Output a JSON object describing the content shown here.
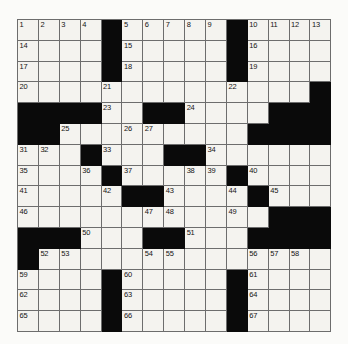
{
  "puzzle": {
    "title": "Crossword Grid",
    "type": "crossword",
    "rows": 15,
    "cols": 15,
    "colors": {
      "block": "#0a0a0a",
      "open": "#f4f3ef",
      "gridline": "#6d6d6d",
      "page": "#fbfbf9",
      "number": "#141414"
    },
    "legend": {
      "block_symbol": "#",
      "open_symbol": "."
    },
    "grid_pattern": [
      "....#.....#....",
      "....#.....#....",
      "....#.....#....",
      "....._....._..#",
      "####.....##....",
      "##.........####",
      "...#...##......",
      "...._#...__#...",
      "....._##...#_..",
      "......__...._##",
      "###..._##..#####",
      "#..........____",
      "....#.....#....",
      "....#.....#....",
      "....#.....#...."
    ],
    "blocks": [
      [
        0,
        4
      ],
      [
        0,
        10
      ],
      [
        1,
        4
      ],
      [
        1,
        10
      ],
      [
        2,
        4
      ],
      [
        2,
        10
      ],
      [
        3,
        14
      ],
      [
        4,
        0
      ],
      [
        4,
        1
      ],
      [
        4,
        2
      ],
      [
        4,
        3
      ],
      [
        4,
        6
      ],
      [
        4,
        7
      ],
      [
        4,
        12
      ],
      [
        4,
        13
      ],
      [
        4,
        14
      ],
      [
        5,
        0
      ],
      [
        5,
        1
      ],
      [
        5,
        11
      ],
      [
        5,
        12
      ],
      [
        5,
        13
      ],
      [
        5,
        14
      ],
      [
        6,
        3
      ],
      [
        6,
        7
      ],
      [
        6,
        8
      ],
      [
        7,
        4
      ],
      [
        7,
        10
      ],
      [
        8,
        5
      ],
      [
        8,
        6
      ],
      [
        8,
        11
      ],
      [
        9,
        12
      ],
      [
        9,
        13
      ],
      [
        9,
        14
      ],
      [
        10,
        0
      ],
      [
        10,
        1
      ],
      [
        10,
        2
      ],
      [
        10,
        6
      ],
      [
        10,
        7
      ],
      [
        10,
        11
      ],
      [
        10,
        12
      ],
      [
        10,
        13
      ],
      [
        10,
        14
      ],
      [
        11,
        0
      ],
      [
        12,
        4
      ],
      [
        12,
        10
      ],
      [
        13,
        4
      ],
      [
        13,
        10
      ],
      [
        14,
        4
      ],
      [
        14,
        10
      ]
    ],
    "numbers": [
      {
        "n": 1,
        "row": 0,
        "col": 0
      },
      {
        "n": 2,
        "row": 0,
        "col": 1
      },
      {
        "n": 3,
        "row": 0,
        "col": 2
      },
      {
        "n": 4,
        "row": 0,
        "col": 3
      },
      {
        "n": 5,
        "row": 0,
        "col": 5
      },
      {
        "n": 6,
        "row": 0,
        "col": 6
      },
      {
        "n": 7,
        "row": 0,
        "col": 7
      },
      {
        "n": 8,
        "row": 0,
        "col": 8
      },
      {
        "n": 9,
        "row": 0,
        "col": 9
      },
      {
        "n": 10,
        "row": 0,
        "col": 11
      },
      {
        "n": 11,
        "row": 0,
        "col": 12
      },
      {
        "n": 12,
        "row": 0,
        "col": 13
      },
      {
        "n": 13,
        "row": 0,
        "col": 14
      },
      {
        "n": 14,
        "row": 1,
        "col": 0
      },
      {
        "n": 15,
        "row": 1,
        "col": 5
      },
      {
        "n": 16,
        "row": 1,
        "col": 11
      },
      {
        "n": 17,
        "row": 2,
        "col": 0
      },
      {
        "n": 18,
        "row": 2,
        "col": 5
      },
      {
        "n": 19,
        "row": 2,
        "col": 11
      },
      {
        "n": 20,
        "row": 3,
        "col": 0
      },
      {
        "n": 21,
        "row": 3,
        "col": 4
      },
      {
        "n": 22,
        "row": 3,
        "col": 10
      },
      {
        "n": 23,
        "row": 4,
        "col": 4
      },
      {
        "n": 24,
        "row": 4,
        "col": 8
      },
      {
        "n": 25,
        "row": 5,
        "col": 2
      },
      {
        "n": 26,
        "row": 5,
        "col": 5
      },
      {
        "n": 27,
        "row": 5,
        "col": 6
      },
      {
        "n": 28,
        "row": 5,
        "col": 12
      },
      {
        "n": 29,
        "row": 5,
        "col": 13
      },
      {
        "n": 30,
        "row": 5,
        "col": 14
      },
      {
        "n": 31,
        "row": 6,
        "col": 0
      },
      {
        "n": 32,
        "row": 6,
        "col": 1
      },
      {
        "n": 33,
        "row": 6,
        "col": 4
      },
      {
        "n": 34,
        "row": 6,
        "col": 9
      },
      {
        "n": 35,
        "row": 7,
        "col": 0
      },
      {
        "n": 36,
        "row": 7,
        "col": 3
      },
      {
        "n": 37,
        "row": 7,
        "col": 5
      },
      {
        "n": 38,
        "row": 7,
        "col": 8
      },
      {
        "n": 39,
        "row": 7,
        "col": 9
      },
      {
        "n": 40,
        "row": 7,
        "col": 11
      },
      {
        "n": 41,
        "row": 8,
        "col": 0
      },
      {
        "n": 42,
        "row": 8,
        "col": 4
      },
      {
        "n": 43,
        "row": 8,
        "col": 7
      },
      {
        "n": 44,
        "row": 8,
        "col": 10
      },
      {
        "n": 45,
        "row": 8,
        "col": 12
      },
      {
        "n": 46,
        "row": 9,
        "col": 0
      },
      {
        "n": 47,
        "row": 9,
        "col": 6
      },
      {
        "n": 48,
        "row": 9,
        "col": 7
      },
      {
        "n": 49,
        "row": 9,
        "col": 10
      },
      {
        "n": 50,
        "row": 10,
        "col": 3
      },
      {
        "n": 51,
        "row": 10,
        "col": 8
      },
      {
        "n": 52,
        "row": 11,
        "col": 1
      },
      {
        "n": 53,
        "row": 11,
        "col": 2
      },
      {
        "n": 54,
        "row": 11,
        "col": 6
      },
      {
        "n": 55,
        "row": 11,
        "col": 7
      },
      {
        "n": 56,
        "row": 11,
        "col": 11
      },
      {
        "n": 57,
        "row": 11,
        "col": 12
      },
      {
        "n": 58,
        "row": 11,
        "col": 13
      },
      {
        "n": 59,
        "row": 12,
        "col": 0
      },
      {
        "n": 60,
        "row": 12,
        "col": 5
      },
      {
        "n": 61,
        "row": 12,
        "col": 11
      },
      {
        "n": 62,
        "row": 13,
        "col": 0
      },
      {
        "n": 63,
        "row": 13,
        "col": 5
      },
      {
        "n": 64,
        "row": 13,
        "col": 11
      },
      {
        "n": 65,
        "row": 14,
        "col": 0
      },
      {
        "n": 66,
        "row": 14,
        "col": 5
      },
      {
        "n": 67,
        "row": 14,
        "col": 11
      }
    ],
    "entries": []
  }
}
